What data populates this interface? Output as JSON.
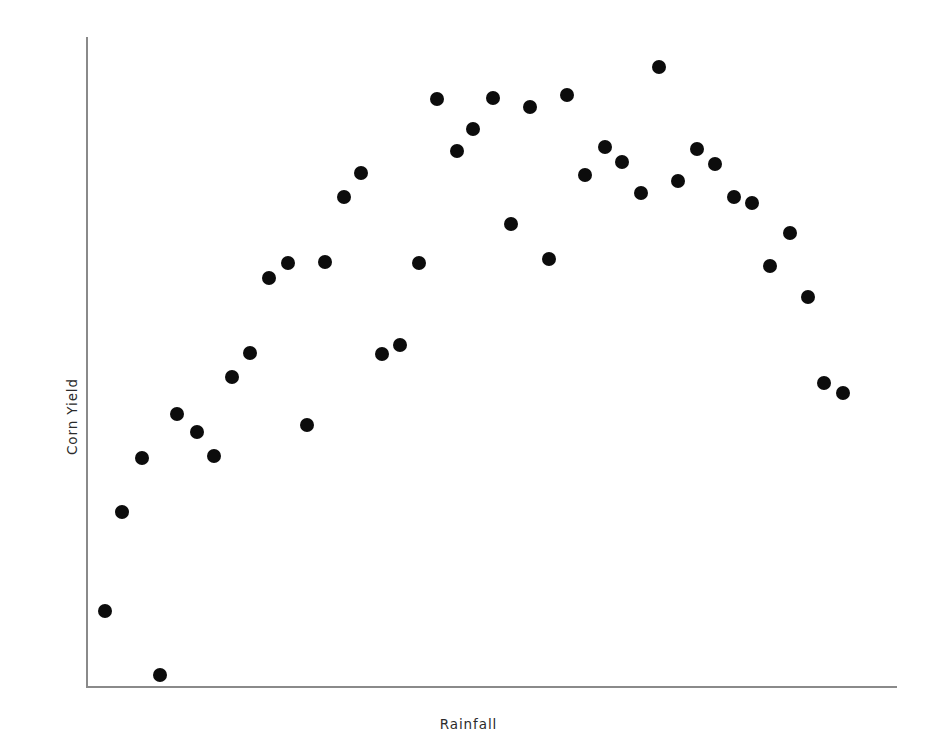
{
  "chart_data": {
    "type": "scatter",
    "title": "",
    "xlabel": "Rainfall",
    "ylabel": "Corn Yield",
    "grid": false,
    "legend": null,
    "xlim": [
      0,
      100
    ],
    "ylim": [
      0,
      100
    ],
    "axis_ticks": {
      "x": [],
      "y": []
    },
    "marker": {
      "shape": "circle",
      "color": "#0c0c0c",
      "size_px": 14
    },
    "n_points": 47,
    "points": [
      {
        "x": 2.3,
        "y": 11.6
      },
      {
        "x": 9.1,
        "y": 2.0
      },
      {
        "x": 4.2,
        "y": 27.0
      },
      {
        "x": 6.6,
        "y": 35.1
      },
      {
        "x": 11.2,
        "y": 42.0
      },
      {
        "x": 13.7,
        "y": 39.2
      },
      {
        "x": 15.8,
        "y": 35.6
      },
      {
        "x": 18.2,
        "y": 47.5
      },
      {
        "x": 20.7,
        "y": 51.5
      },
      {
        "x": 23.1,
        "y": 65.2
      },
      {
        "x": 25.4,
        "y": 67.5
      },
      {
        "x": 27.3,
        "y": 38.6
      },
      {
        "x": 29.2,
        "y": 67.4
      },
      {
        "x": 31.4,
        "y": 73.2
      },
      {
        "x": 33.8,
        "y": 76.7
      },
      {
        "x": 36.2,
        "y": 50.9
      },
      {
        "x": 38.4,
        "y": 52.3
      },
      {
        "x": 40.8,
        "y": 67.2
      },
      {
        "x": 43.3,
        "y": 84.9
      },
      {
        "x": 45.6,
        "y": 77.7
      },
      {
        "x": 47.7,
        "y": 82.0
      },
      {
        "x": 50.2,
        "y": 84.9
      },
      {
        "x": 52.4,
        "y": 71.5
      },
      {
        "x": 54.6,
        "y": 83.9
      },
      {
        "x": 56.8,
        "y": 67.4
      },
      {
        "x": 59.1,
        "y": 88.3
      },
      {
        "x": 61.4,
        "y": 92.6
      },
      {
        "x": 63.6,
        "y": 76.1
      },
      {
        "x": 65.8,
        "y": 79.1
      },
      {
        "x": 68.0,
        "y": 76.8
      },
      {
        "x": 70.5,
        "y": 73.3
      },
      {
        "x": 72.6,
        "y": 75.4
      },
      {
        "x": 75.0,
        "y": 78.0
      },
      {
        "x": 77.3,
        "y": 79.5
      },
      {
        "x": 79.4,
        "y": 76.0
      },
      {
        "x": 81.5,
        "y": 74.1
      },
      {
        "x": 83.8,
        "y": 70.5
      },
      {
        "x": 86.0,
        "y": 63.7
      },
      {
        "x": 88.2,
        "y": 58.6
      },
      {
        "x": 90.6,
        "y": 52.7
      },
      {
        "x": 93.0,
        "y": 38.9
      },
      {
        "x": 95.3,
        "y": 37.2
      },
      {
        "x": 59.8,
        "y": 83.2
      },
      {
        "x": 35.5,
        "y": 79.6
      },
      {
        "x": 22.1,
        "y": 63.2
      },
      {
        "x": 16.9,
        "y": 29.3
      },
      {
        "x": 46.8,
        "y": 80.0
      }
    ],
    "pixel_points": [
      {
        "cx": 105,
        "cy": 611
      },
      {
        "cx": 160,
        "cy": 675
      },
      {
        "cx": 122,
        "cy": 512
      },
      {
        "cx": 142,
        "cy": 458
      },
      {
        "cx": 177,
        "cy": 414
      },
      {
        "cx": 197,
        "cy": 432
      },
      {
        "cx": 214,
        "cy": 456
      },
      {
        "cx": 232,
        "cy": 377
      },
      {
        "cx": 250,
        "cy": 353
      },
      {
        "cx": 269,
        "cy": 278
      },
      {
        "cx": 288,
        "cy": 263
      },
      {
        "cx": 307,
        "cy": 425
      },
      {
        "cx": 325,
        "cy": 262
      },
      {
        "cx": 344,
        "cy": 197
      },
      {
        "cx": 361,
        "cy": 173
      },
      {
        "cx": 382,
        "cy": 354
      },
      {
        "cx": 400,
        "cy": 345
      },
      {
        "cx": 419,
        "cy": 263
      },
      {
        "cx": 437,
        "cy": 99
      },
      {
        "cx": 457,
        "cy": 151
      },
      {
        "cx": 473,
        "cy": 129
      },
      {
        "cx": 493,
        "cy": 98
      },
      {
        "cx": 511,
        "cy": 224
      },
      {
        "cx": 530,
        "cy": 107
      },
      {
        "cx": 549,
        "cy": 259
      },
      {
        "cx": 567,
        "cy": 95
      },
      {
        "cx": 585,
        "cy": 175
      },
      {
        "cx": 605,
        "cy": 147
      },
      {
        "cx": 622,
        "cy": 162
      },
      {
        "cx": 641,
        "cy": 193
      },
      {
        "cx": 659,
        "cy": 67
      },
      {
        "cx": 678,
        "cy": 181
      },
      {
        "cx": 697,
        "cy": 149
      },
      {
        "cx": 715,
        "cy": 164
      },
      {
        "cx": 734,
        "cy": 197
      },
      {
        "cx": 752,
        "cy": 203
      },
      {
        "cx": 770,
        "cy": 266
      },
      {
        "cx": 790,
        "cy": 233
      },
      {
        "cx": 808,
        "cy": 297
      },
      {
        "cx": 824,
        "cy": 383
      },
      {
        "cx": 843,
        "cy": 393
      }
    ]
  },
  "labels": {
    "x_axis": "Rainfall",
    "y_axis": "Corn Yield",
    "title": ""
  },
  "colors": {
    "marker": "#0c0c0c",
    "axis": "#8a8a8a",
    "background": "#ffffff",
    "text": "#2b2b2b"
  }
}
